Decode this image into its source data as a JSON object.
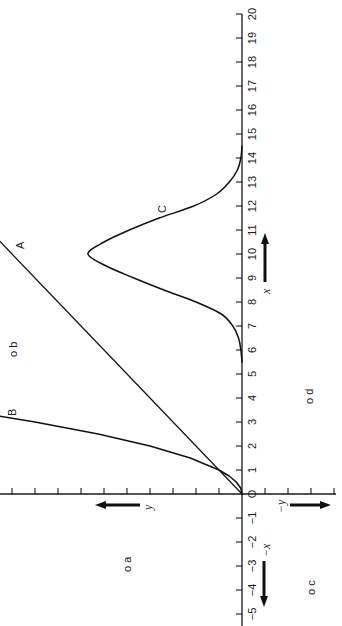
{
  "chart_data": {
    "type": "line",
    "orientation": "rotated 90° counter-clockwise (x-axis runs bottom-to-top, y-axis runs right-to-left)",
    "title": "",
    "xlabel": "x",
    "ylabel": "y",
    "negative_xlabel": "−x",
    "negative_ylabel": "−y",
    "origin_label": "O",
    "xlim": [
      -5,
      20
    ],
    "ylim": [
      -4,
      10.5
    ],
    "x_ticks": [
      -5,
      -4,
      -3,
      -2,
      -1,
      0,
      1,
      2,
      3,
      4,
      5,
      6,
      7,
      8,
      9,
      10,
      11,
      12,
      13,
      14,
      15,
      16,
      17,
      18,
      19,
      20
    ],
    "x_tick_labels": [
      "−5",
      "−4",
      "−3",
      "−2",
      "−1",
      "O",
      "1",
      "2",
      "3",
      "4",
      "5",
      "6",
      "7",
      "8",
      "9",
      "10",
      "11",
      "12",
      "13",
      "14",
      "15",
      "16",
      "17",
      "18",
      "19",
      "20"
    ],
    "y_ticks_unlabeled": [
      -4,
      -3,
      -2,
      -1,
      1,
      2,
      3,
      4,
      5,
      6,
      7,
      8,
      9,
      10
    ],
    "grid": false,
    "legend": "none (curves labeled inline)",
    "series": [
      {
        "name": "A",
        "description": "straight line through origin",
        "x": [
          0,
          1,
          2,
          4,
          6,
          8,
          10,
          10.6
        ],
        "y": [
          0,
          1,
          2,
          4,
          6,
          8,
          10,
          10.6
        ]
      },
      {
        "name": "B",
        "description": "steep curve through origin, crossing A at (1,1)",
        "x": [
          0,
          0.25,
          0.5,
          0.75,
          1,
          1.5,
          2,
          2.5,
          3,
          3.3
        ],
        "y": [
          0,
          0.06,
          0.25,
          0.56,
          1,
          2.25,
          4,
          6.25,
          9,
          10.9
        ]
      },
      {
        "name": "C",
        "description": "bell-shaped peak centred at x = 10",
        "x": [
          5.5,
          6,
          6.5,
          7,
          7.5,
          8,
          8.5,
          9,
          9.5,
          10,
          10.5,
          11,
          11.5,
          12,
          12.5,
          13,
          13.5,
          14,
          14.5
        ],
        "y": [
          0,
          0.05,
          0.15,
          0.4,
          0.9,
          2.0,
          3.4,
          4.7,
          5.9,
          6.7,
          6.0,
          4.9,
          3.6,
          2.1,
          1.1,
          0.55,
          0.2,
          0.05,
          0
        ]
      }
    ],
    "annotations": [
      {
        "text": "a",
        "marker": "o",
        "x": -2.8,
        "y": 5.0,
        "quadrant": "x<0, y>0"
      },
      {
        "text": "b",
        "marker": "o",
        "x": 6.3,
        "y": 9.9,
        "quadrant": "x>0, y>0"
      },
      {
        "text": "c",
        "marker": "o",
        "x": -3.8,
        "y": -3.0,
        "quadrant": "x<0, y<0"
      },
      {
        "text": "d",
        "marker": "o",
        "x": 4.3,
        "y": -2.9,
        "quadrant": "x>0, y<0"
      }
    ]
  },
  "labels": {
    "curve_a": "A",
    "curve_b": "B",
    "curve_c": "C",
    "point_a": "o a",
    "point_b": "o b",
    "point_c": "o c",
    "point_d": "o d",
    "arrow_x": "x",
    "arrow_neg_x": "−x",
    "arrow_y": "y",
    "arrow_neg_y": "−y",
    "origin": "O"
  }
}
